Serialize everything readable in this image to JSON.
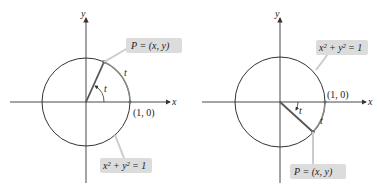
{
  "figures": [
    {
      "id": "left",
      "axis_x_label": "x",
      "axis_y_label": "y",
      "point_label": "P = (x, y)",
      "arc_label": "t",
      "angle_label": "t",
      "unit_point_label": "(1, 0)",
      "equation_label": "x² + y² = 1",
      "direction": "counterclockwise"
    },
    {
      "id": "right",
      "axis_x_label": "x",
      "axis_y_label": "y",
      "point_label": "P = (x, y)",
      "arc_label": "t",
      "angle_label": "t",
      "unit_point_label": "(1, 0)",
      "equation_label": "x² + y² = 1",
      "direction": "clockwise"
    }
  ],
  "colors": {
    "axis": "#333333",
    "circle": "#333333",
    "radius": "#555555",
    "arc_highlight": "#777777",
    "callout_box": "#dcdcdc",
    "leader": "#cccccc"
  }
}
